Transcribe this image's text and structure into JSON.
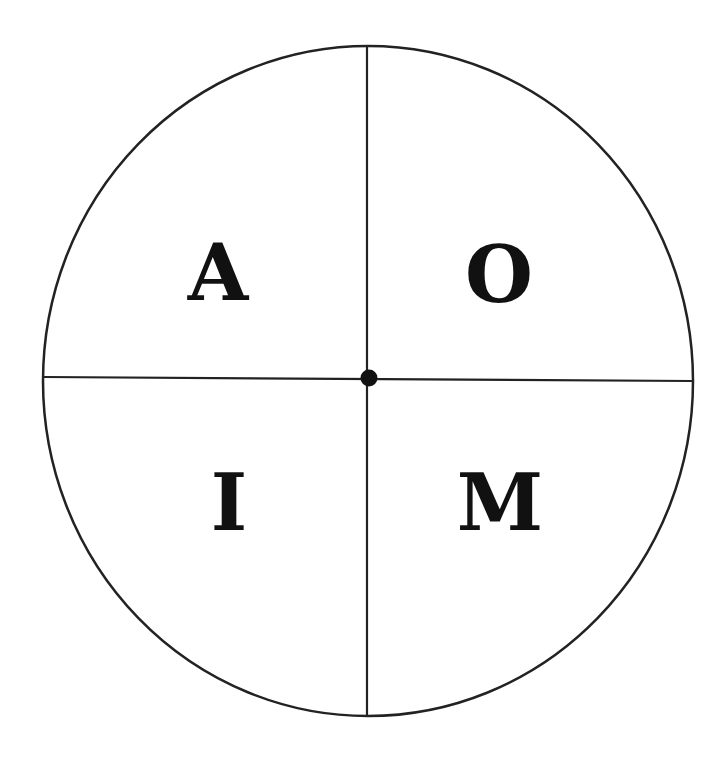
{
  "diagram": {
    "type": "quadrant-circle",
    "quadrants": {
      "top_left": "A",
      "top_right": "O",
      "bottom_left": "I",
      "bottom_right": "M"
    },
    "colors": {
      "stroke": "#222222",
      "background": "#ffffff"
    }
  }
}
